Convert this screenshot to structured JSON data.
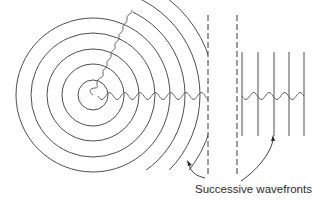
{
  "diagram": {
    "caption": "Successive wavefronts",
    "colors": {
      "background": "#ffffff",
      "line": "#3a3a3a",
      "wave": "#555555",
      "text": "#2a2a2a"
    },
    "source": {
      "x": 93,
      "y": 95
    },
    "circles": [
      {
        "r": 15
      },
      {
        "r": 31
      },
      {
        "r": 46
      },
      {
        "r": 62
      },
      {
        "r": 77
      }
    ],
    "partial_arcs": [
      {
        "r": 92
      },
      {
        "r": 107
      },
      {
        "r": 122
      }
    ],
    "dashed_lines": [
      {
        "x": 208,
        "y1": 15,
        "y2": 176
      },
      {
        "x": 237,
        "y1": 15,
        "y2": 176
      }
    ],
    "plane_wavefronts": [
      {
        "x": 242
      },
      {
        "x": 258
      },
      {
        "x": 274
      },
      {
        "x": 289
      },
      {
        "x": 304
      }
    ],
    "caption_position": {
      "x": 195,
      "y": 187
    }
  }
}
